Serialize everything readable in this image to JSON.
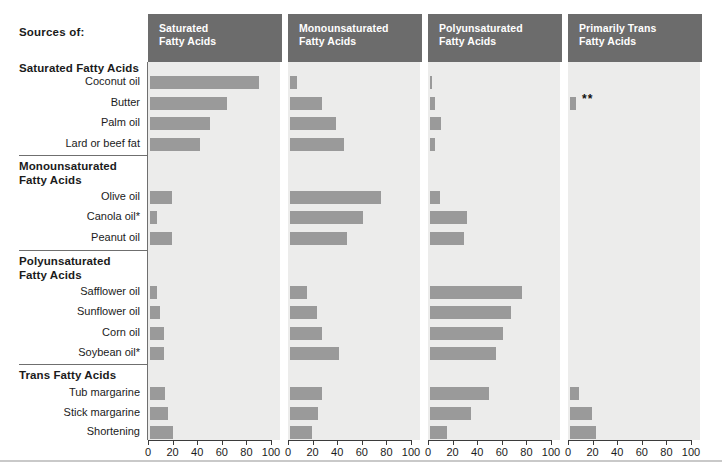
{
  "header": {
    "sources_label": "Sources of:"
  },
  "groups": [
    {
      "id": "saturated",
      "title": "Saturated Fatty Acids",
      "rows": [
        "Coconut oil",
        "Butter",
        "Palm oil",
        "Lard or beef fat"
      ]
    },
    {
      "id": "monounsaturated",
      "title": "Monounsaturated\nFatty Acids",
      "rows": [
        "Olive oil",
        "Canola oil*",
        "Peanut oil"
      ]
    },
    {
      "id": "polyunsaturated",
      "title": "Polyunsaturated\nFatty Acids",
      "rows": [
        "Safflower oil",
        "Sunflower oil",
        "Corn oil",
        "Soybean oil*"
      ]
    },
    {
      "id": "trans",
      "title": "Trans Fatty Acids",
      "rows": [
        "Tub margarine",
        "Stick margarine",
        "Shortening"
      ]
    }
  ],
  "annotations": {
    "butter_trans_marker": "**"
  },
  "colors": {
    "header_fill": "#6c6c6c",
    "header_text": "#ffffff",
    "plot_background": "#ececeb",
    "bar_fill": "#9a9a9a",
    "axis": "#3b3b3b",
    "rule": "#6f6f6f"
  },
  "chart_data": {
    "type": "bar",
    "orientation": "horizontal",
    "panels": [
      "Saturated Fatty Acids",
      "Monounsaturated Fatty Acids",
      "Polyunsaturated Fatty Acids",
      "Primarily Trans Fatty Acids"
    ],
    "xlabel": "",
    "ylabel": "",
    "xlim": [
      0,
      100
    ],
    "xticks": [
      0,
      20,
      40,
      60,
      80,
      100
    ],
    "xticklabels": [
      "0",
      "20",
      "40",
      "60",
      "80",
      "100"
    ],
    "grid": false,
    "legend": "none",
    "categories": [
      "Coconut oil",
      "Butter",
      "Palm oil",
      "Lard or beef fat",
      "Olive oil",
      "Canola oil*",
      "Peanut oil",
      "Safflower oil",
      "Sunflower oil",
      "Corn oil",
      "Soybean oil*",
      "Tub margarine",
      "Stick margarine",
      "Shortening"
    ],
    "series": [
      {
        "name": "Saturated Fatty Acids",
        "values": [
          89,
          63,
          49,
          41,
          18,
          6,
          18,
          6,
          8,
          11,
          11,
          12,
          15,
          19
        ]
      },
      {
        "name": "Monounsaturated Fatty Acids",
        "values": [
          6,
          26,
          37,
          44,
          74,
          59,
          46,
          14,
          22,
          26,
          40,
          26,
          23,
          18
        ]
      },
      {
        "name": "Polyunsaturated Fatty Acids",
        "values": [
          2,
          4,
          9,
          4,
          8,
          30,
          28,
          75,
          66,
          59,
          54,
          48,
          33,
          14
        ]
      },
      {
        "name": "Primarily Trans Fatty Acids",
        "values": [
          0,
          5,
          0,
          0,
          0,
          0,
          0,
          0,
          0,
          0,
          0,
          7,
          18,
          21
        ]
      }
    ],
    "notes": [
      "*",
      "**"
    ]
  }
}
